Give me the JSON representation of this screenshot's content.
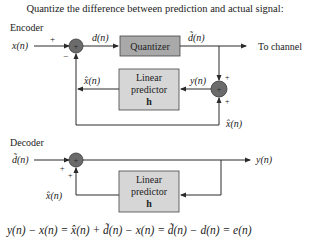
{
  "title": "Quantize the difference between prediction and actual signal:",
  "encoder": {
    "label": "Encoder",
    "input_label": "x(n)",
    "sum1_signs": {
      "input": "+",
      "feedback": "−"
    },
    "diff_label": "d(n)",
    "quantizer_label": "Quantizer",
    "quantized_label": "d̃(n)",
    "output_label": "To channel",
    "predictor": {
      "line1": "Linear",
      "line2": "predictor",
      "line3": "h"
    },
    "prediction_label": "x̂(n)",
    "y_label": "y(n)",
    "sum2_signs": {
      "top": "+",
      "bottom": "+"
    },
    "feedback_label": "x̂(n)"
  },
  "decoder": {
    "label": "Decoder",
    "input_label": "d̃(n)",
    "sum_signs": {
      "left": "+",
      "bottom": "+"
    },
    "output_label": "y(n)",
    "predictor": {
      "line1": "Linear",
      "line2": "predictor",
      "line3": "h"
    },
    "prediction_label": "x̂(n)"
  },
  "equation": "y(n) − x(n) = x̂(n) + d̃(n) − x(n) = d̃(n) − d(n) = e(n)",
  "colors": {
    "quantizer_fill": "#a9a9a9",
    "predictor_fill": "#d6d6d6",
    "summer_fill": "#6b6b6b",
    "line": "#2a2a2a"
  }
}
